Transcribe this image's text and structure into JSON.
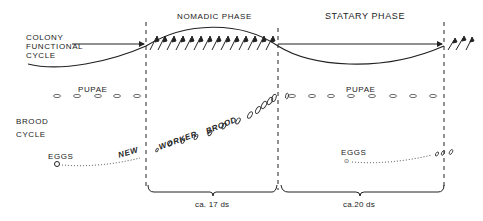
{
  "phases": {
    "nomadic": {
      "label": "NOMADIC PHASE",
      "duration": "ca. 17 ds"
    },
    "statary": {
      "label": "STATARY PHASE",
      "duration": "ca.20 ds"
    }
  },
  "rows": {
    "colony": {
      "line1": "COLONY",
      "line2": "FUNCTIONAL",
      "line3": "CYCLE"
    },
    "brood": {
      "line1": "BROOD",
      "line2": "CYCLE"
    }
  },
  "stages": {
    "pupae_left": "PUPAE",
    "pupae_right": "PUPAE",
    "eggs_left": "EGGS",
    "eggs_right": "EGGS",
    "new_worker_brood": [
      "NEW",
      "WORKER",
      "BROOD"
    ]
  },
  "colors": {
    "ink": "#222222",
    "background": "#ffffff"
  }
}
